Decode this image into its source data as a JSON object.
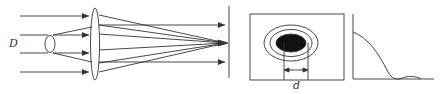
{
  "figure": {
    "labels": {
      "beam_diameter": "D",
      "spot_diameter": "d"
    },
    "parts": [
      "incident-parallel-beam",
      "beam-expander-ellipse",
      "converging-lens",
      "focal-plane-screen",
      "airy-disk-pattern",
      "intensity-profile-plot"
    ],
    "colors": {
      "line": "#333333",
      "spot": "#111111",
      "background": "#ffffff"
    }
  }
}
